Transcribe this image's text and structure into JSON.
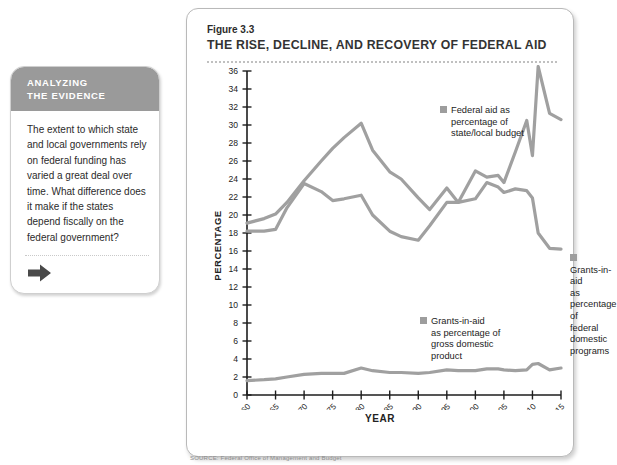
{
  "callout": {
    "header_line1": "ANALYZING",
    "header_line2": "THE EVIDENCE",
    "question": "The extent to which state and local governments rely on federal funding has varied a great deal over time. What difference does it make if the states depend fiscally on the federal government?",
    "arrow_icon": "arrow-right-icon"
  },
  "figure": {
    "number": "Figure 3.3",
    "title": "THE RISE, DECLINE, AND RECOVERY OF FEDERAL AID",
    "source": "SOURCE: Federal Office of Management and Budget"
  },
  "legend": {
    "budget": "Federal aid as percentage of state/local budget",
    "budget_lines": [
      "Federal aid as",
      "percentage of",
      "state/local budget"
    ],
    "domestic": "Grants-in-aid as percentage of federal domestic programs",
    "domestic_lines": [
      "Grants-in-aid",
      "as percentage of",
      "federal domestic",
      "programs"
    ],
    "gdp": "Grants-in-aid as percentage of gross domestic product",
    "gdp_lines": [
      "Grants-in-aid",
      "as percentage of",
      "gross domestic",
      "product"
    ],
    "swatch_color": "#9d9d9d"
  },
  "chart_data": {
    "type": "line",
    "title": "THE RISE, DECLINE, AND RECOVERY OF FEDERAL AID",
    "xlabel": "YEAR",
    "ylabel": "PERCENTAGE",
    "xlim": [
      1960,
      2015
    ],
    "ylim": [
      0,
      36
    ],
    "ytick_step": 2,
    "yticks": [
      0,
      2,
      4,
      6,
      8,
      10,
      12,
      14,
      16,
      18,
      20,
      22,
      24,
      26,
      28,
      30,
      32,
      34,
      36
    ],
    "xticks": [
      1960,
      1965,
      1970,
      1975,
      1980,
      1985,
      1990,
      1995,
      2000,
      2005,
      2010,
      2015
    ],
    "xtick_labels": [
      "1960",
      "1965",
      "1970",
      "1975",
      "1980",
      "1985",
      "1990",
      "1995",
      "2000",
      "2005",
      "2010",
      "2015"
    ],
    "grid": false,
    "legend_position": "inside",
    "line_color": "#a0a0a0",
    "series": [
      {
        "name": "Federal aid as percentage of state/local budget",
        "x": [
          1960,
          1963,
          1965,
          1967,
          1970,
          1973,
          1975,
          1977,
          1980,
          1982,
          1985,
          1987,
          1990,
          1992,
          1995,
          1997,
          2000,
          2002,
          2004,
          2005,
          2007,
          2009,
          2010,
          2011,
          2013,
          2015
        ],
        "values": [
          19.1,
          19.6,
          20.1,
          21.4,
          23.8,
          26.0,
          27.4,
          28.6,
          30.2,
          27.2,
          24.8,
          24.0,
          21.9,
          20.6,
          23.0,
          21.4,
          24.9,
          24.2,
          24.4,
          23.6,
          27.0,
          30.5,
          26.6,
          36.5,
          31.3,
          30.6
        ]
      },
      {
        "name": "Grants-in-aid as percentage of federal domestic programs",
        "x": [
          1960,
          1963,
          1965,
          1967,
          1970,
          1973,
          1975,
          1977,
          1980,
          1982,
          1985,
          1987,
          1990,
          1992,
          1995,
          1997,
          2000,
          2002,
          2004,
          2005,
          2007,
          2009,
          2010,
          2011,
          2013,
          2015
        ],
        "values": [
          18.2,
          18.2,
          18.4,
          20.8,
          23.5,
          22.6,
          21.6,
          21.8,
          22.2,
          20.0,
          18.2,
          17.6,
          17.2,
          18.8,
          21.4,
          21.4,
          21.8,
          23.6,
          23.1,
          22.5,
          22.9,
          22.7,
          21.9,
          18.0,
          16.3,
          16.2
        ]
      },
      {
        "name": "Grants-in-aid as percentage of gross domestic product",
        "x": [
          1960,
          1963,
          1965,
          1967,
          1970,
          1973,
          1975,
          1977,
          1980,
          1982,
          1985,
          1987,
          1990,
          1992,
          1995,
          1997,
          2000,
          2002,
          2004,
          2005,
          2007,
          2009,
          2010,
          2011,
          2013,
          2015
        ],
        "values": [
          1.6,
          1.7,
          1.8,
          2.0,
          2.3,
          2.4,
          2.4,
          2.4,
          3.0,
          2.7,
          2.5,
          2.5,
          2.4,
          2.5,
          2.8,
          2.7,
          2.7,
          2.9,
          2.9,
          2.8,
          2.7,
          2.8,
          3.4,
          3.5,
          2.8,
          3.0
        ]
      }
    ]
  }
}
